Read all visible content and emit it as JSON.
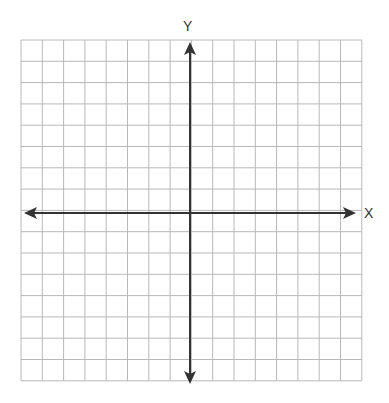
{
  "diagram": {
    "type": "cartesian-grid",
    "x_axis_label": "X",
    "y_axis_label": "Y",
    "grid": {
      "columns": 16,
      "rows": 16,
      "left": 21,
      "top": 40,
      "cell": 21.3
    },
    "colors": {
      "grid": "#b8b8b8",
      "axis": "#333333"
    }
  }
}
